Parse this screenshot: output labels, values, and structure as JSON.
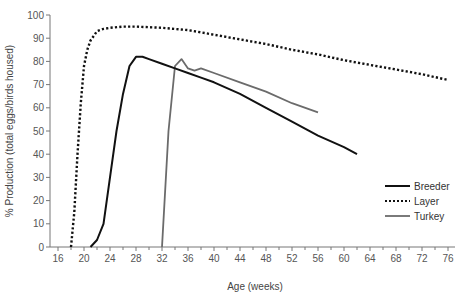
{
  "chart_data": {
    "type": "line",
    "title": "",
    "xlabel": "Age (weeks)",
    "ylabel": "% Production (total eggs/birds housed)",
    "xlim": [
      16,
      76
    ],
    "ylim": [
      0,
      100
    ],
    "x_ticks": [
      16,
      20,
      24,
      28,
      32,
      36,
      40,
      44,
      48,
      52,
      56,
      60,
      64,
      68,
      72,
      76
    ],
    "y_ticks": [
      0,
      10,
      20,
      30,
      40,
      50,
      60,
      70,
      80,
      90,
      100
    ],
    "grid": false,
    "legend_position": "lower right",
    "series": [
      {
        "name": "Breeder",
        "style": "solid",
        "color": "#111111",
        "x": [
          21,
          22,
          23,
          24,
          25,
          26,
          27,
          28,
          29,
          30,
          32,
          34,
          36,
          38,
          40,
          44,
          48,
          52,
          56,
          60,
          62
        ],
        "y": [
          0,
          3,
          10,
          30,
          50,
          66,
          78,
          82,
          82,
          81,
          79,
          77,
          75,
          73,
          71,
          66,
          60,
          54,
          48,
          43,
          40
        ]
      },
      {
        "name": "Layer",
        "style": "dotted",
        "color": "#111111",
        "x": [
          18,
          18.5,
          19,
          19.5,
          20,
          20.5,
          21,
          21.5,
          22,
          23,
          24,
          26,
          28,
          32,
          36,
          40,
          44,
          48,
          52,
          56,
          60,
          64,
          68,
          72,
          76
        ],
        "y": [
          0,
          15,
          40,
          62,
          78,
          85,
          89,
          91,
          93,
          94,
          94.5,
          95,
          95,
          94.5,
          93.5,
          91.5,
          89.5,
          87.5,
          85,
          83,
          80.5,
          78.5,
          76.5,
          74.5,
          72
        ]
      },
      {
        "name": "Turkey",
        "style": "solid",
        "color": "#6b6b6b",
        "x": [
          32,
          33,
          34,
          35,
          36,
          37,
          38,
          40,
          44,
          48,
          52,
          56
        ],
        "y": [
          0,
          50,
          78,
          81,
          77,
          76,
          77,
          75,
          71,
          67,
          62,
          58
        ]
      }
    ]
  }
}
